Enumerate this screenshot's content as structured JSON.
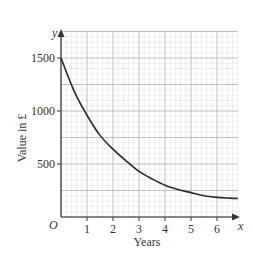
{
  "chart_data": {
    "type": "line",
    "title": "",
    "xlabel": "Years",
    "ylabel": "Value in £",
    "x_axis_symbol": "x",
    "y_axis_symbol": "y",
    "origin_label": "O",
    "xlim": [
      0,
      6.8
    ],
    "ylim": [
      0,
      1750
    ],
    "x_ticks": [
      1,
      2,
      3,
      4,
      5,
      6
    ],
    "x_tick_labels": [
      "1",
      "2",
      "3",
      "4",
      "5",
      "6"
    ],
    "y_ticks": [
      500,
      1000,
      1500
    ],
    "y_tick_labels": [
      "500",
      "1000",
      "1500"
    ],
    "grid": true,
    "legend": null,
    "series": [
      {
        "name": "Value",
        "x": [
          0,
          0.5,
          1,
          1.5,
          2,
          2.5,
          3,
          3.5,
          4,
          4.5,
          5,
          5.5,
          6,
          6.5,
          6.8
        ],
        "values": [
          1500,
          1190,
          960,
          770,
          640,
          530,
          430,
          360,
          300,
          260,
          230,
          200,
          185,
          178,
          175
        ]
      }
    ],
    "colors": {
      "curve": "#2b2b2b",
      "axis": "#333333",
      "grid_major": "#b0b0b0",
      "grid_minor": "#dcdcdc"
    }
  }
}
